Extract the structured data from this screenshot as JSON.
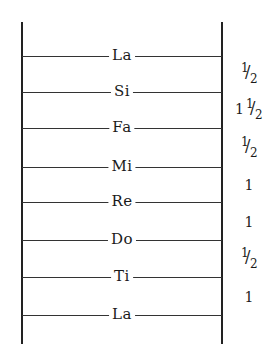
{
  "diagram": {
    "type": "scale-ladder",
    "notes": [
      {
        "label": "La",
        "y": 56
      },
      {
        "label": "Si",
        "y": 92
      },
      {
        "label": "Fa",
        "y": 128
      },
      {
        "label": "Mi",
        "y": 167
      },
      {
        "label": "Re",
        "y": 202
      },
      {
        "label": "Do",
        "y": 240
      },
      {
        "label": "Ti",
        "y": 277
      },
      {
        "label": "La",
        "y": 315
      }
    ],
    "intervals": [
      {
        "text": "1/2",
        "whole": "",
        "num": "1",
        "den": "2",
        "y": 74
      },
      {
        "text": "1 1/2",
        "whole": "1",
        "num": "1",
        "den": "2",
        "y": 110
      },
      {
        "text": "1/2",
        "whole": "",
        "num": "1",
        "den": "2",
        "y": 147
      },
      {
        "text": "1",
        "whole": "1",
        "num": "",
        "den": "",
        "y": 185
      },
      {
        "text": "1",
        "whole": "1",
        "num": "",
        "den": "",
        "y": 221
      },
      {
        "text": "1/2",
        "whole": "",
        "num": "1",
        "den": "2",
        "y": 258
      },
      {
        "text": "1",
        "whole": "1",
        "num": "",
        "den": "",
        "y": 296
      }
    ]
  }
}
